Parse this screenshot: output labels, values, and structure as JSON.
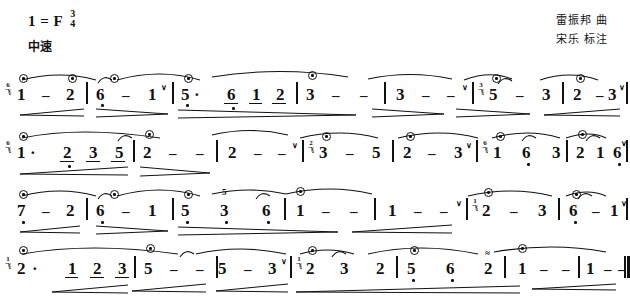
{
  "header": {
    "key_label": "1 = F",
    "time_num": "3",
    "time_den": "4",
    "tempo": "中速",
    "credit_composer": "雷振邦 曲",
    "credit_annotator": "宋乐 标注"
  },
  "score": {
    "notation_type": "jianpu",
    "lines": [
      {
        "id": "line-1",
        "measures": [
          {
            "notes": [
              "1",
              "-",
              "2"
            ],
            "string_mark": "6",
            "harmonic": [
              0
            ]
          },
          {
            "notes": [
              "6̣",
              "-",
              "1"
            ],
            "harmonic": [
              0
            ],
            "bow": "∨"
          },
          {
            "notes": [
              "5·",
              "6̣",
              "1",
              "2"
            ],
            "harmonic": [
              0
            ],
            "beamed": [
              1,
              2,
              3
            ]
          },
          {
            "notes": [
              "3",
              "-",
              "-"
            ],
            "harmonic": [
              0
            ]
          },
          {
            "notes": [
              "3",
              "-",
              "-"
            ],
            "bow": "∨"
          },
          {
            "notes": [
              "5",
              "-",
              "3"
            ],
            "string_mark": "3",
            "harmonic": [
              0
            ]
          },
          {
            "notes": [
              "2",
              "-",
              "3"
            ],
            "harmonic": [
              0
            ],
            "bow": "∨"
          }
        ]
      },
      {
        "id": "line-2",
        "measures": [
          {
            "notes": [
              "1·",
              "2",
              "3",
              "5"
            ],
            "string_mark": "6",
            "harmonic": [
              0
            ],
            "beamed": [
              1,
              2,
              3
            ]
          },
          {
            "notes": [
              "2",
              "-",
              "-"
            ],
            "harmonic": [
              0
            ]
          },
          {
            "notes": [
              "2",
              "-",
              "-"
            ],
            "bow": "∨"
          },
          {
            "notes": [
              "3",
              "-",
              "5"
            ],
            "string_mark": "2",
            "harmonic": [
              0
            ]
          },
          {
            "notes": [
              "2",
              "-",
              "3"
            ],
            "harmonic": [
              0
            ],
            "bow": "∨"
          },
          {
            "notes": [
              "1",
              "6̣",
              "3"
            ],
            "string_mark": "6",
            "harmonic": [
              0
            ]
          },
          {
            "notes": [
              "2",
              "1",
              "6̣"
            ],
            "harmonic": [
              0
            ],
            "bow": "∨"
          }
        ]
      },
      {
        "id": "line-3",
        "measures": [
          {
            "notes": [
              "7̣",
              "-",
              "2"
            ],
            "harmonic": [
              0
            ]
          },
          {
            "notes": [
              "6̣",
              "-",
              "1"
            ],
            "harmonic": [
              0
            ]
          },
          {
            "notes": [
              "5̣",
              "3̣",
              "6̣"
            ],
            "harmonic": [
              0
            ],
            "alt_above": "5"
          },
          {
            "notes": [
              "1",
              "-",
              "-"
            ],
            "harmonic": [
              0
            ]
          },
          {
            "notes": [
              "1",
              "-",
              "-"
            ],
            "bow": "∨"
          },
          {
            "notes": [
              "2",
              "-",
              "3"
            ],
            "string_mark": "1",
            "harmonic": [
              0
            ]
          },
          {
            "notes": [
              "6̣",
              "-",
              "1"
            ],
            "harmonic": [
              0
            ],
            "bow": "∨"
          }
        ]
      },
      {
        "id": "line-4",
        "measures": [
          {
            "notes": [
              "2·",
              "1",
              "2",
              "3"
            ],
            "string_mark": "1",
            "harmonic": [
              0
            ],
            "beamed": [
              1,
              2,
              3
            ]
          },
          {
            "notes": [
              "5",
              "-",
              "-"
            ],
            "harmonic": [
              0
            ]
          },
          {
            "notes": [
              "5",
              "-",
              "3"
            ],
            "bow": "∨"
          },
          {
            "notes": [
              "2",
              "3",
              "2"
            ],
            "string_mark": "1",
            "harmonic": [
              0
            ]
          },
          {
            "notes": [
              "5̣",
              "6̣",
              "2"
            ],
            "harmonic": [
              0
            ],
            "trill_on": 2
          },
          {
            "notes": [
              "1",
              "-",
              "-"
            ],
            "harmonic": [
              0
            ]
          },
          {
            "notes": [
              "1",
              "-",
              "-"
            ],
            "end": "double-barline"
          }
        ]
      }
    ]
  },
  "glyphs": {
    "harmonic": "⊙",
    "bow_up": "∨",
    "trill": "≈",
    "string_sub": "飞",
    "dash": "-",
    "aug_dot": "·"
  }
}
